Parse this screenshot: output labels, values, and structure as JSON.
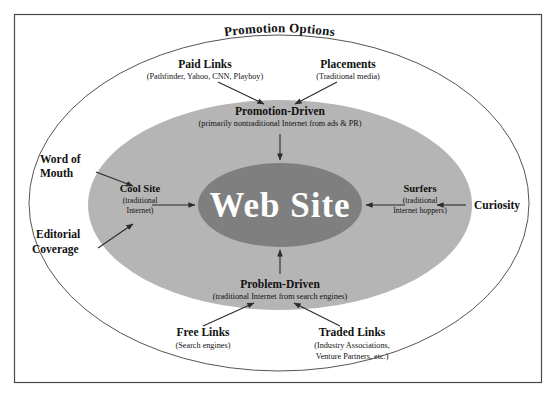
{
  "diagram": {
    "title": "Promotion Options",
    "center": {
      "label": "Web Site"
    },
    "zones": {
      "promotion_driven": {
        "label": "Promotion-Driven",
        "sub": "(primarily nontraditional Internet from ads & PR)"
      },
      "problem_driven": {
        "label": "Problem-Driven",
        "sub": "(traditional Internet from search engines)"
      },
      "cool_site": {
        "label": "Cool Site",
        "sub_line1": "(traditional",
        "sub_line2": "Internet)"
      },
      "surfers": {
        "label": "Surfers",
        "sub_line1": "(traditional",
        "sub_line2": "Internet hoppers)"
      }
    },
    "drivers": {
      "paid_links": {
        "label": "Paid Links",
        "sub": "(Pathfinder, Yahoo, CNN, Playboy)"
      },
      "placements": {
        "label": "Placements",
        "sub": "(Traditional media)"
      },
      "word_of_mouth": {
        "line1": "Word of",
        "line2": "Mouth"
      },
      "editorial_coverage": {
        "line1": "Editorial",
        "line2": "Coverage"
      },
      "curiosity": {
        "label": "Curiosity"
      },
      "free_links": {
        "label": "Free Links",
        "sub": "(Search engines)"
      },
      "traded_links": {
        "label": "Traded Links",
        "sub_line1": "(Industry Associations,",
        "sub_line2": "Venture Partners, etc.)"
      }
    },
    "colors": {
      "background": "#ffffff",
      "frame_stroke": "#4a4a4a",
      "outer_ellipse_fill": "#ffffff",
      "outer_ellipse_stroke": "#555555",
      "mid_ellipse_fill": "#b5b5b5",
      "inner_ellipse_fill": "#7f7f7f",
      "text": "#111111",
      "center_text": "#ffffff",
      "arrow": "#2b2b2b"
    }
  }
}
